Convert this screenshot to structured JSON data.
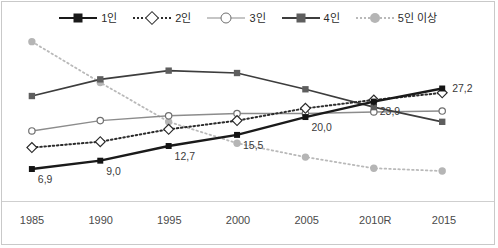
{
  "chart_data": {
    "type": "line",
    "title": "",
    "subtitle": "",
    "xlabel": "",
    "ylabel": "",
    "grid": false,
    "legend_position": "top-center",
    "categories": [
      "1985",
      "1990",
      "1995",
      "2000",
      "2005",
      "2010R",
      "2015"
    ],
    "ylim": [
      0,
      40
    ],
    "series": [
      {
        "name": "1인",
        "marker": "filled-square",
        "line": "solid",
        "color": "#1a1a1a",
        "values": [
          6.9,
          9.0,
          12.7,
          15.5,
          20.0,
          23.9,
          27.2
        ],
        "data_labels": [
          "6,9",
          "9,0",
          "12,7",
          "15,5",
          "20,0",
          "23,9",
          "27,2"
        ]
      },
      {
        "name": "2인",
        "marker": "open-diamond",
        "line": "dotted",
        "color": "#2b2b2b",
        "values": [
          12.3,
          13.8,
          16.9,
          19.1,
          22.2,
          24.3,
          26.1
        ],
        "data_labels": []
      },
      {
        "name": "3인",
        "marker": "open-circle",
        "line": "solid",
        "color": "#8c8c8c",
        "values": [
          16.5,
          19.1,
          20.3,
          20.9,
          20.9,
          21.3,
          21.5
        ],
        "data_labels": []
      },
      {
        "name": "4인",
        "marker": "filled-square",
        "line": "solid",
        "color": "#6b6b6b",
        "values": [
          25.3,
          29.5,
          31.7,
          31.1,
          27.0,
          22.5,
          18.8
        ],
        "data_labels": []
      },
      {
        "name": "5인 이상",
        "marker": "filled-circle",
        "line": "dotted",
        "color": "#b9b9b9",
        "values": [
          39.0,
          28.7,
          18.8,
          13.4,
          9.9,
          7.1,
          6.4
        ],
        "data_labels": []
      }
    ]
  },
  "legend": {
    "items": [
      {
        "label": "1인"
      },
      {
        "label": "2인"
      },
      {
        "label": "3인"
      },
      {
        "label": "4인"
      },
      {
        "label": "5인 이상"
      }
    ]
  },
  "axis": {
    "x_tick_labels": [
      "1985",
      "1990",
      "1995",
      "2000",
      "2005",
      "2010R",
      "2015"
    ]
  },
  "colors": {
    "series_1in": "#1a1a1a",
    "series_2in": "#2b2b2b",
    "series_3in": "#8c8c8c",
    "series_4in": "#6b6b6b",
    "series_5in_plus": "#b9b9b9",
    "frame": "#c9c9c9",
    "axis_line": "#cfcfcf",
    "label_text": "#3a3a3a",
    "background": "#ffffff"
  }
}
